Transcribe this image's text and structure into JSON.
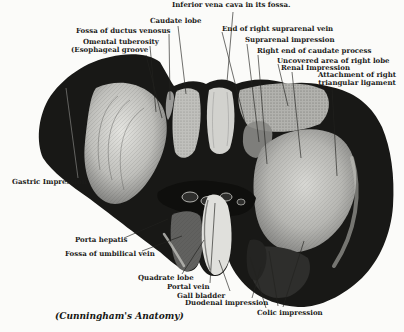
{
  "figure": {
    "caption": "(Cunningham's Anatomy)",
    "ink_color": "#1b1b19",
    "paper_color": "#fbfbf9",
    "labels": {
      "ivc": "Inferior vena cava in its fossa.",
      "caudate_lobe": "Caudate lobe",
      "fossa_ductus_venosus": "Fossa of ductus venosus",
      "omental_tuberosity": "Omental tuberosity",
      "esophageal_groove": "(Esophageal groove",
      "suprarenal_vein": "End of right suprarenal vein",
      "suprarenal_impression": "Suprarenal impression",
      "caudate_process": "Right end of caudate process",
      "uncovered_area": "Uncovered area of right lobe",
      "renal_impression": "Renal Impression",
      "triangular_ligament": "Attachment of right triangular ligament",
      "gastric_impression": "Gastric Impression",
      "porta_hepatis": "Porta hepatis",
      "umbilical_vein": "Fossa of umbilical vein",
      "quadrate_lobe": "Quadrate lobe",
      "portal_vein": "Portal vein",
      "gall_bladder": "Gall bladder",
      "duodenal_impression": "Duodenal impression",
      "colic_impression": "Colic impression"
    }
  }
}
